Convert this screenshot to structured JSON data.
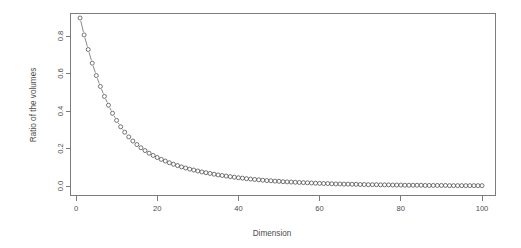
{
  "chart_data": {
    "type": "scatter",
    "title": "",
    "subtitle": "",
    "xlabel": "Dimension",
    "ylabel": "Ratio of the volumes",
    "xlim": [
      0,
      101
    ],
    "ylim": [
      0.0,
      0.9
    ],
    "grid": false,
    "legend": null,
    "marker": "open-circle",
    "line_style": "thin-connecting-line",
    "xticks": [
      0,
      20,
      40,
      60,
      80,
      100
    ],
    "xtick_labels": [
      "0",
      "20",
      "40",
      "60",
      "80",
      "100"
    ],
    "yticks": [
      0.0,
      0.2,
      0.4,
      0.6,
      0.8
    ],
    "ytick_labels": [
      "0.0",
      "0.2",
      "0.4",
      "0.6",
      "0.8"
    ],
    "series": [
      {
        "name": "Ratio of the volumes",
        "x": [
          1,
          2,
          3,
          4,
          5,
          6,
          7,
          8,
          9,
          10,
          11,
          12,
          13,
          14,
          15,
          16,
          17,
          18,
          19,
          20,
          21,
          22,
          23,
          24,
          25,
          26,
          27,
          28,
          29,
          30,
          31,
          32,
          33,
          34,
          35,
          36,
          37,
          38,
          39,
          40,
          41,
          42,
          43,
          44,
          45,
          46,
          47,
          48,
          49,
          50,
          51,
          52,
          53,
          54,
          55,
          56,
          57,
          58,
          59,
          60,
          61,
          62,
          63,
          64,
          65,
          66,
          67,
          68,
          69,
          70,
          71,
          72,
          73,
          74,
          75,
          76,
          77,
          78,
          79,
          80,
          81,
          82,
          83,
          84,
          85,
          86,
          87,
          88,
          89,
          90,
          91,
          92,
          93,
          94,
          95,
          96,
          97,
          98,
          99,
          100
        ],
        "values": [
          0.896,
          0.806,
          0.728,
          0.655,
          0.589,
          0.531,
          0.478,
          0.431,
          0.388,
          0.35,
          0.316,
          0.287,
          0.262,
          0.24,
          0.221,
          0.204,
          0.189,
          0.175,
          0.163,
          0.152,
          0.142,
          0.133,
          0.124,
          0.116,
          0.109,
          0.102,
          0.096,
          0.09,
          0.085,
          0.08,
          0.075,
          0.071,
          0.067,
          0.063,
          0.059,
          0.056,
          0.053,
          0.05,
          0.047,
          0.044,
          0.042,
          0.039,
          0.037,
          0.035,
          0.033,
          0.031,
          0.029,
          0.028,
          0.026,
          0.025,
          0.023,
          0.022,
          0.021,
          0.02,
          0.019,
          0.018,
          0.017,
          0.016,
          0.015,
          0.014,
          0.013,
          0.013,
          0.012,
          0.011,
          0.011,
          0.01,
          0.01,
          0.009,
          0.009,
          0.008,
          0.008,
          0.007,
          0.007,
          0.007,
          0.006,
          0.006,
          0.006,
          0.005,
          0.005,
          0.005,
          0.004,
          0.004,
          0.004,
          0.004,
          0.004,
          0.003,
          0.003,
          0.003,
          0.003,
          0.003,
          0.003,
          0.002,
          0.002,
          0.002,
          0.002,
          0.002,
          0.002,
          0.002,
          0.002,
          0.002
        ]
      }
    ],
    "colors": {
      "marker": "#4a4a4a",
      "line": "#555555",
      "axis": "#6e6e6e",
      "text": "#4d4d4d",
      "background": "#ffffff"
    }
  }
}
